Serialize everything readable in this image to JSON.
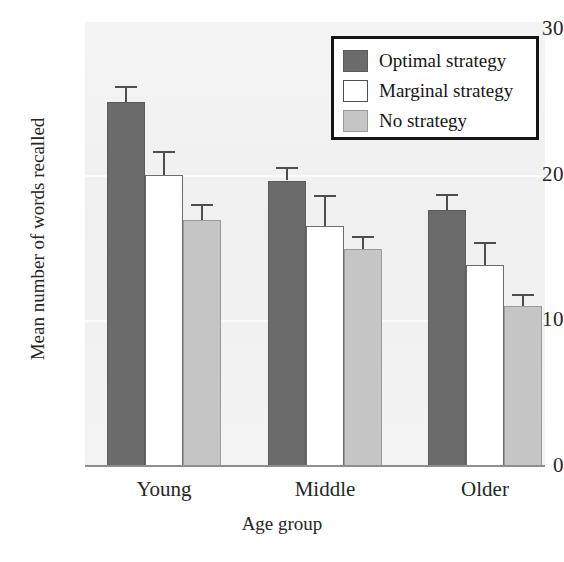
{
  "chart_data": {
    "type": "bar",
    "title": "",
    "xlabel": "Age group",
    "ylabel": "Mean number of words recalled",
    "categories": [
      "Young",
      "Middle",
      "Older"
    ],
    "ylim": [
      0,
      30
    ],
    "yticks": [
      0,
      10,
      20,
      30
    ],
    "ytick_labels": [
      "0",
      "10",
      "20",
      "30"
    ],
    "grid": false,
    "legend_position": "top-right",
    "series": [
      {
        "name": "Optimal strategy",
        "color": "#6b6b6b",
        "values": [
          25.0,
          19.6,
          17.6
        ],
        "errors": [
          1.1,
          0.9,
          1.1
        ]
      },
      {
        "name": "Marginal strategy",
        "color": "#ffffff",
        "values": [
          20.0,
          16.5,
          13.8
        ],
        "errors": [
          1.6,
          2.1,
          1.6
        ]
      },
      {
        "name": "No strategy",
        "color": "#c5c5c5",
        "values": [
          16.9,
          14.9,
          11.0
        ],
        "errors": [
          1.1,
          0.9,
          0.8
        ]
      }
    ]
  },
  "axes": {
    "y_label": "Mean number of words recalled",
    "x_label": "Age group",
    "y_tick_0": "0",
    "y_tick_1": "10",
    "y_tick_2": "20",
    "y_tick_3": "30",
    "x_tick_0": "Young",
    "x_tick_1": "Middle",
    "x_tick_2": "Older"
  },
  "legend": {
    "items": [
      {
        "label": "Optimal strategy",
        "swatch": "optimal"
      },
      {
        "label": "Marginal strategy",
        "swatch": "marginal"
      },
      {
        "label": "No strategy",
        "swatch": "none"
      }
    ]
  }
}
